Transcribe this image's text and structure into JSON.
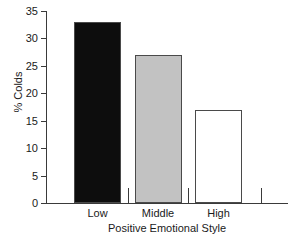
{
  "chart_data": {
    "type": "bar",
    "title": "",
    "xlabel": "Positive Emotional Style",
    "ylabel": "% Colds",
    "categories": [
      "Low",
      "Middle",
      "High"
    ],
    "values": [
      33,
      27,
      17
    ],
    "bar_colors": [
      "#0d0d0d",
      "#c2c2c2",
      "#ffffff"
    ],
    "bar_border_color": "#4a4a4a",
    "ylim": [
      0,
      35
    ],
    "yticks": [
      0,
      5,
      10,
      15,
      20,
      25,
      30,
      35
    ],
    "ytick_labels": [
      "0",
      "5",
      "10",
      "15",
      "20",
      "25",
      "30",
      "35"
    ],
    "grid": false,
    "legend": "none",
    "axis_color": "#3a3a3a"
  }
}
